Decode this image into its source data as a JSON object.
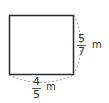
{
  "shape": {
    "type": "rectangle",
    "stroke": "#2a2a2a",
    "dash_color": "#9a9a9a"
  },
  "labels": {
    "width": {
      "numerator": "4",
      "denominator": "5",
      "unit": "m"
    },
    "height": {
      "numerator": "5",
      "denominator": "7",
      "unit": "m"
    }
  }
}
